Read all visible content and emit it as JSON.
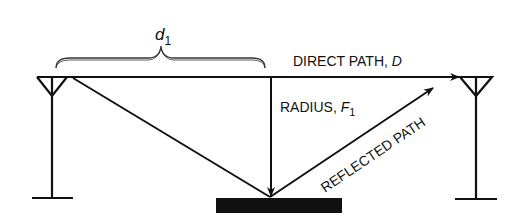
{
  "diagram": {
    "type": "fresnel-zone-reflection",
    "labels": {
      "distance": {
        "main": "d",
        "sub": "1"
      },
      "direct_path": {
        "prefix": "DIRECT PATH, ",
        "var": "D"
      },
      "radius": {
        "prefix": "RADIUS, ",
        "var": "F",
        "sub": "1"
      },
      "reflected_path": "REFLECTED PATH"
    },
    "elements": [
      "transmit-antenna",
      "receive-antenna",
      "direct-path-arrow",
      "reflected-path",
      "radius-arrow",
      "reflecting-surface",
      "distance-brace"
    ],
    "colors": {
      "line": "#111111",
      "background": "#ffffff"
    }
  }
}
